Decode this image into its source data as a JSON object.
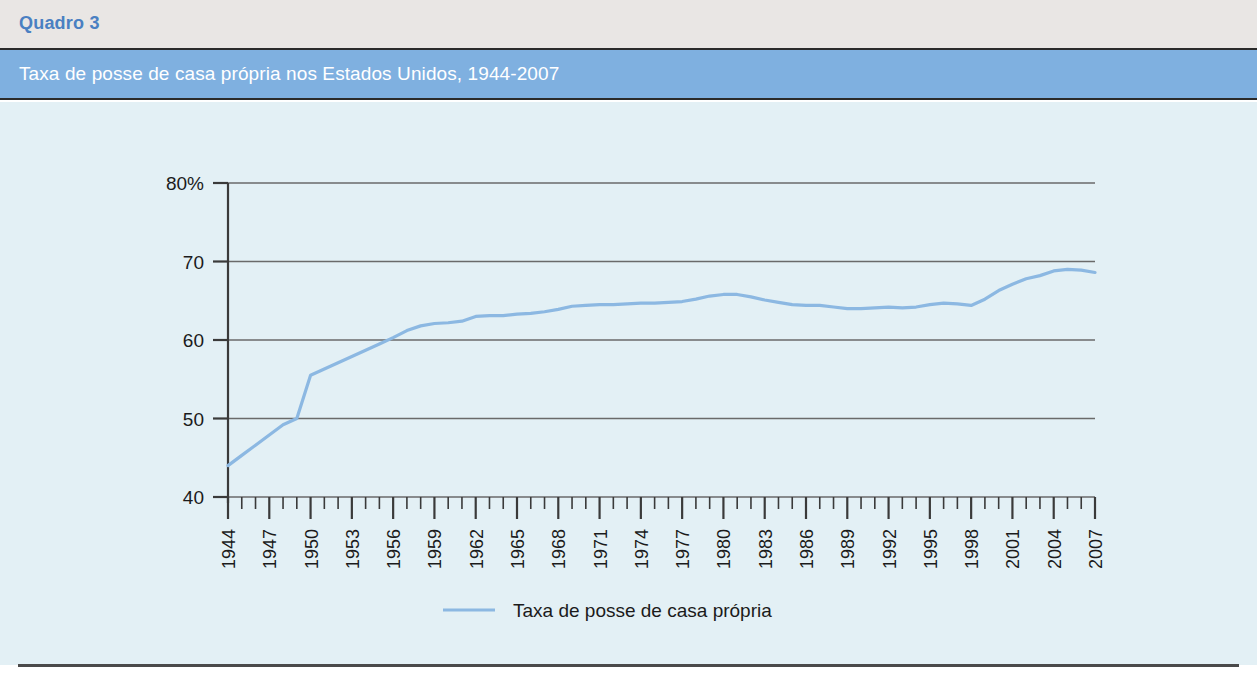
{
  "header": {
    "table_number": "Quadro 3",
    "title": "Taxa de posse de casa própria nos Estados Unidos, 1944-2007"
  },
  "colors": {
    "band_top_bg": "#e9e6e4",
    "band_top_text": "#4a80c2",
    "band_title_bg": "#7fb0e0",
    "band_title_text": "#ffffff",
    "panel_bg": "#e3f0f5",
    "series_line": "#8cb8e2",
    "axis": "#3a3a3a",
    "gridline": "#6a6a6a"
  },
  "chart_data": {
    "type": "line",
    "title": "Taxa de posse de casa própria nos Estados Unidos, 1944-2007",
    "xlabel": "",
    "ylabel": "",
    "ylim": [
      40,
      80
    ],
    "xlim": [
      1944,
      2007
    ],
    "grid": true,
    "legend_position": "bottom-center",
    "y_ticks": [
      40,
      50,
      60,
      70,
      80
    ],
    "y_tick_labels": [
      "40",
      "50",
      "60",
      "70",
      "80%"
    ],
    "x_ticks": [
      1944,
      1947,
      1950,
      1953,
      1956,
      1959,
      1962,
      1965,
      1968,
      1971,
      1974,
      1977,
      1980,
      1983,
      1986,
      1989,
      1992,
      1995,
      1998,
      2001,
      2004,
      2007
    ],
    "x_tick_labels": [
      "1944",
      "1947",
      "1950",
      "1953",
      "1956",
      "1959",
      "1962",
      "1965",
      "1968",
      "1971",
      "1974",
      "1977",
      "1980",
      "1983",
      "1986",
      "1989",
      "1992",
      "1995",
      "1998",
      "2001",
      "2004",
      "2007"
    ],
    "x_tick_rotation": -90,
    "minor_ticks_between": true,
    "series": [
      {
        "name": "Taxa de posse de casa própria",
        "color": "#8cb8e2",
        "x": [
          1944,
          1945,
          1946,
          1947,
          1948,
          1949,
          1950,
          1951,
          1952,
          1953,
          1954,
          1955,
          1956,
          1957,
          1958,
          1959,
          1960,
          1961,
          1962,
          1963,
          1964,
          1965,
          1966,
          1967,
          1968,
          1969,
          1970,
          1971,
          1972,
          1973,
          1974,
          1975,
          1976,
          1977,
          1978,
          1979,
          1980,
          1981,
          1982,
          1983,
          1984,
          1985,
          1986,
          1987,
          1988,
          1989,
          1990,
          1991,
          1992,
          1993,
          1994,
          1995,
          1996,
          1997,
          1998,
          1999,
          2000,
          2001,
          2002,
          2003,
          2004,
          2005,
          2006,
          2007
        ],
        "values": [
          44.0,
          45.3,
          46.6,
          47.9,
          49.2,
          50.0,
          55.5,
          56.3,
          57.1,
          57.9,
          58.7,
          59.5,
          60.3,
          61.2,
          61.8,
          62.1,
          62.2,
          62.4,
          63.0,
          63.1,
          63.1,
          63.3,
          63.4,
          63.6,
          63.9,
          64.3,
          64.4,
          64.5,
          64.5,
          64.6,
          64.7,
          64.7,
          64.8,
          64.9,
          65.2,
          65.6,
          65.8,
          65.8,
          65.5,
          65.1,
          64.8,
          64.5,
          64.4,
          64.4,
          64.2,
          64.0,
          64.0,
          64.1,
          64.2,
          64.1,
          64.2,
          64.5,
          64.7,
          64.6,
          64.4,
          65.2,
          66.3,
          67.1,
          67.8,
          68.2,
          68.8,
          69.0,
          68.9,
          68.6
        ]
      }
    ]
  },
  "legend": {
    "entries": [
      {
        "label": "Taxa de posse de casa própria",
        "color": "#8cb8e2"
      }
    ]
  }
}
